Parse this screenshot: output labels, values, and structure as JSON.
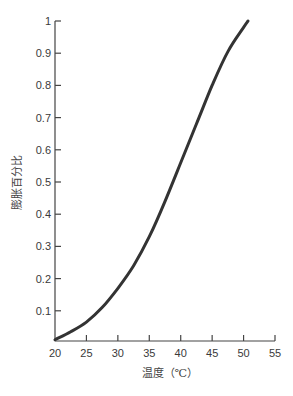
{
  "chart_data": {
    "type": "line",
    "title": "",
    "xlabel": "温度（℃）",
    "ylabel": "膨胀百分比",
    "xlim": [
      20,
      55
    ],
    "ylim": [
      0,
      1
    ],
    "x_ticks": [
      "20",
      "25",
      "30",
      "35",
      "40",
      "45",
      "50",
      "55"
    ],
    "y_ticks": [
      "0.1",
      "0.2",
      "0.3",
      "0.4",
      "0.5",
      "0.6",
      "0.7",
      "0.8",
      "0.9",
      "1"
    ],
    "grid": false,
    "legend": null,
    "series": [
      {
        "name": "膨胀百分比",
        "color": "#333333",
        "x": [
          20,
          22.5,
          25,
          27.5,
          30,
          32.5,
          35,
          37.5,
          40,
          42.5,
          45,
          47.5,
          50,
          50.7
        ],
        "values": [
          0.01,
          0.035,
          0.065,
          0.11,
          0.17,
          0.24,
          0.33,
          0.44,
          0.56,
          0.68,
          0.8,
          0.905,
          0.98,
          1.0
        ]
      }
    ]
  }
}
